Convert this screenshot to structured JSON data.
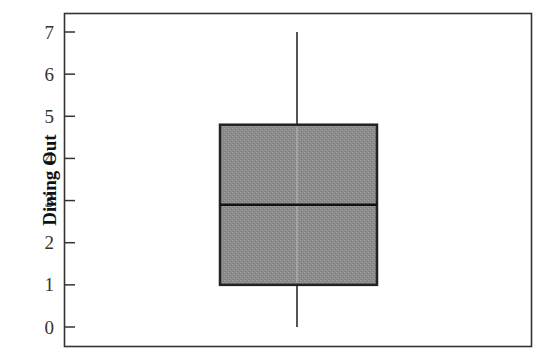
{
  "chart_data": {
    "type": "box",
    "title": "",
    "xlabel": "",
    "ylabel": "Dining Out",
    "ylim": [
      0,
      7
    ],
    "yticks": [
      0,
      1,
      2,
      3,
      4,
      5,
      6,
      7
    ],
    "grid": false,
    "series": [
      {
        "name": "Dining Out",
        "min": 0,
        "q1": 1.0,
        "median": 2.9,
        "q3": 4.8,
        "max": 7.0
      }
    ]
  },
  "colors": {
    "box_fill": "#8a8a8a",
    "box_stroke": "#222222",
    "axis": "#333333",
    "whisker": "#555555"
  }
}
